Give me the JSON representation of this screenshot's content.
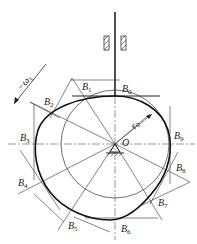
{
  "diagram": {
    "type": "cam-follower mechanism",
    "labels": {
      "omega": "−ω",
      "omega_sub": "1",
      "r0": "r",
      "r0_sub": "0",
      "center": "O",
      "points": [
        {
          "name": "B",
          "sub": "0",
          "x": 122,
          "y": 92
        },
        {
          "name": "B",
          "sub": "1",
          "x": 82,
          "y": 88
        },
        {
          "name": "B",
          "sub": "2",
          "x": 44,
          "y": 105
        },
        {
          "name": "B",
          "sub": "3",
          "x": 20,
          "y": 141
        },
        {
          "name": "B",
          "sub": "4",
          "x": 18,
          "y": 187
        },
        {
          "name": "B",
          "sub": "5",
          "x": 70,
          "y": 229
        },
        {
          "name": "B",
          "sub": "6",
          "x": 121,
          "y": 232
        },
        {
          "name": "B",
          "sub": "7",
          "x": 158,
          "y": 207
        },
        {
          "name": "B",
          "sub": "8",
          "x": 176,
          "y": 172
        },
        {
          "name": "B",
          "sub": "9",
          "x": 174,
          "y": 139
        }
      ]
    },
    "colors": {
      "line": "#222222",
      "profile": "#111111",
      "background": "#ffffff"
    }
  }
}
